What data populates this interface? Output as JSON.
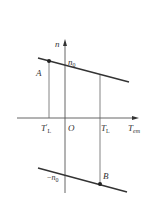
{
  "diagram": {
    "type": "mechanical-characteristic",
    "axes": {
      "y_label": "n",
      "x_label_main": "T",
      "x_label_sub": "em",
      "origin_label": "O"
    },
    "ticks": {
      "left_main": "T",
      "left_prime": "′",
      "left_sub": "L",
      "right_main": "T",
      "right_sub": "L"
    },
    "intercepts": {
      "top_main": "n",
      "top_sub": "0",
      "bottom_sign": "−",
      "bottom_main": "n",
      "bottom_sub": "0"
    },
    "points": {
      "a_label": "A",
      "b_label": "B"
    },
    "colors": {
      "line": "#333333",
      "thin": "#555555",
      "background": "#ffffff"
    }
  }
}
